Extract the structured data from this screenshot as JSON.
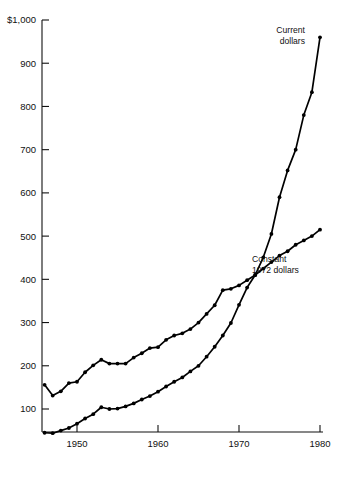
{
  "chart_data": {
    "type": "line",
    "title": "",
    "subtitle": "",
    "xlabel": "",
    "ylabel": "",
    "xlim": [
      1946,
      1980
    ],
    "ylim": [
      0,
      1000
    ],
    "grid": false,
    "legend_position": "inline-annotations",
    "x_ticks": [
      1950,
      1960,
      1970,
      1980
    ],
    "x_tick_labels": [
      "1950",
      "1960",
      "1970",
      "1980"
    ],
    "y_ticks": [
      100,
      200,
      300,
      400,
      500,
      600,
      700,
      800,
      900,
      1000
    ],
    "y_tick_labels": [
      "100",
      "200",
      "300",
      "400",
      "500",
      "600",
      "700",
      "800",
      "900",
      "$1,000"
    ],
    "x": [
      1946,
      1947,
      1948,
      1949,
      1950,
      1951,
      1952,
      1953,
      1954,
      1955,
      1956,
      1957,
      1958,
      1959,
      1960,
      1961,
      1962,
      1963,
      1964,
      1965,
      1966,
      1967,
      1968,
      1969,
      1970,
      1971,
      1972,
      1973,
      1974,
      1975,
      1976,
      1977,
      1978,
      1979,
      1980
    ],
    "series": [
      {
        "name": "Current dollars",
        "label_line1": "Current",
        "label_line2": "dollars",
        "color": "#000000",
        "marker": "circle",
        "values": [
          45,
          44,
          50,
          56,
          66,
          78,
          88,
          104,
          100,
          101,
          106,
          113,
          122,
          130,
          140,
          152,
          163,
          173,
          187,
          200,
          221,
          244,
          270,
          299,
          341,
          381,
          410,
          451,
          505,
          590,
          652,
          700,
          780,
          833,
          960
        ]
      },
      {
        "name": "Constant 1972 dollars",
        "label_line1": "Constant",
        "label_line2": "1972 dollars",
        "color": "#000000",
        "marker": "circle",
        "values": [
          156,
          131,
          141,
          160,
          163,
          185,
          201,
          214,
          205,
          205,
          205,
          219,
          229,
          241,
          243,
          260,
          270,
          275,
          285,
          300,
          320,
          340,
          375,
          378,
          386,
          398,
          410,
          425,
          440,
          455,
          465,
          480,
          490,
          500,
          515
        ]
      }
    ],
    "annotations": [
      {
        "text": "Current dollars",
        "series": "Current dollars",
        "at_x": 1980
      },
      {
        "text": "Constant 1972 dollars",
        "series": "Constant 1972 dollars",
        "at_x": 1975
      }
    ]
  }
}
